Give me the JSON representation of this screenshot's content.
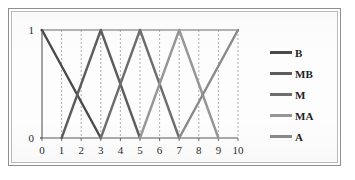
{
  "figure": {
    "border_color": "#8f8f92",
    "background": "#ffffff"
  },
  "chart_data": {
    "type": "line",
    "title": "",
    "subtitle": "",
    "xlabel": "",
    "ylabel": "",
    "xlim": [
      0,
      10
    ],
    "ylim": [
      0,
      1
    ],
    "xticks": [
      "0",
      "1",
      "2",
      "3",
      "4",
      "5",
      "6",
      "7",
      "8",
      "9",
      "10"
    ],
    "yticks": [
      "0",
      "1"
    ],
    "grid": "vertical-dashed",
    "legend_position": "right",
    "series": [
      {
        "name": "B",
        "color": "#4a4a4a",
        "x": [
          0,
          3
        ],
        "y": [
          1,
          0
        ],
        "shape": "right-triangle-descending"
      },
      {
        "name": "MB",
        "color": "#5d5d5d",
        "x": [
          1,
          3,
          5
        ],
        "y": [
          0,
          1,
          0
        ],
        "shape": "triangle"
      },
      {
        "name": "M",
        "color": "#6e6e6e",
        "x": [
          3,
          5,
          7
        ],
        "y": [
          0,
          1,
          0
        ],
        "shape": "triangle"
      },
      {
        "name": "MA",
        "color": "#969696",
        "x": [
          5,
          7,
          9
        ],
        "y": [
          0,
          1,
          0
        ],
        "shape": "triangle"
      },
      {
        "name": "A",
        "color": "#8a8a8a",
        "x": [
          7,
          10
        ],
        "y": [
          0,
          1
        ],
        "shape": "right-triangle-ascending"
      }
    ]
  },
  "legend": {
    "items": [
      {
        "label": "B",
        "color": "#4a4a4a"
      },
      {
        "label": "MB",
        "color": "#5d5d5d"
      },
      {
        "label": "M",
        "color": "#6e6e6e"
      },
      {
        "label": "MA",
        "color": "#969696"
      },
      {
        "label": "A",
        "color": "#8a8a8a"
      }
    ]
  }
}
